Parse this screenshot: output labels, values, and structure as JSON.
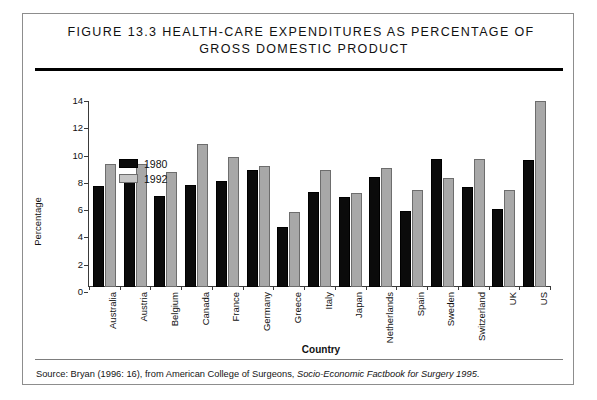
{
  "figure": {
    "title_line1": "Figure 13.3  Health-Care Expenditures as Percentage of",
    "title_line2": "Gross Domestic Product",
    "source_prefix": "Source:  Bryan (1996: 16), from American College of Surgeons, ",
    "source_italic": "Socio-Economic Factbook for Surgery 1995",
    "source_suffix": "."
  },
  "legend": {
    "items": [
      {
        "label": "1980",
        "color": "#0b0b0b"
      },
      {
        "label": "1992",
        "color": "#c6c6c6"
      }
    ]
  },
  "chart_data": {
    "type": "bar",
    "title": "Figure 13.3  Health-Care Expenditures as Percentage of Gross Domestic Product",
    "xlabel": "Country",
    "ylabel": "Percentage",
    "ylim": [
      0,
      14
    ],
    "yticks": [
      0,
      2,
      4,
      6,
      8,
      10,
      12,
      14
    ],
    "grid": false,
    "legend_position": "top-left",
    "categories": [
      "Australia",
      "Austria",
      "Belgium",
      "Canada",
      "France",
      "Germany",
      "Greece",
      "Italy",
      "Japan",
      "Netherlands",
      "Spain",
      "Sweden",
      "Switzerland",
      "UK",
      "US"
    ],
    "series": [
      {
        "name": "1980",
        "color": "#0b0b0b",
        "values": [
          7.4,
          8.1,
          6.7,
          7.5,
          7.8,
          8.6,
          4.4,
          7.0,
          6.6,
          8.1,
          5.6,
          9.4,
          7.3,
          5.7,
          9.3
        ]
      },
      {
        "name": "1992",
        "color": "#a8a8a8",
        "values": [
          9.0,
          9.0,
          8.4,
          10.5,
          9.5,
          8.9,
          5.5,
          8.6,
          6.9,
          8.7,
          7.1,
          8.0,
          9.4,
          7.1,
          13.6
        ]
      }
    ]
  }
}
